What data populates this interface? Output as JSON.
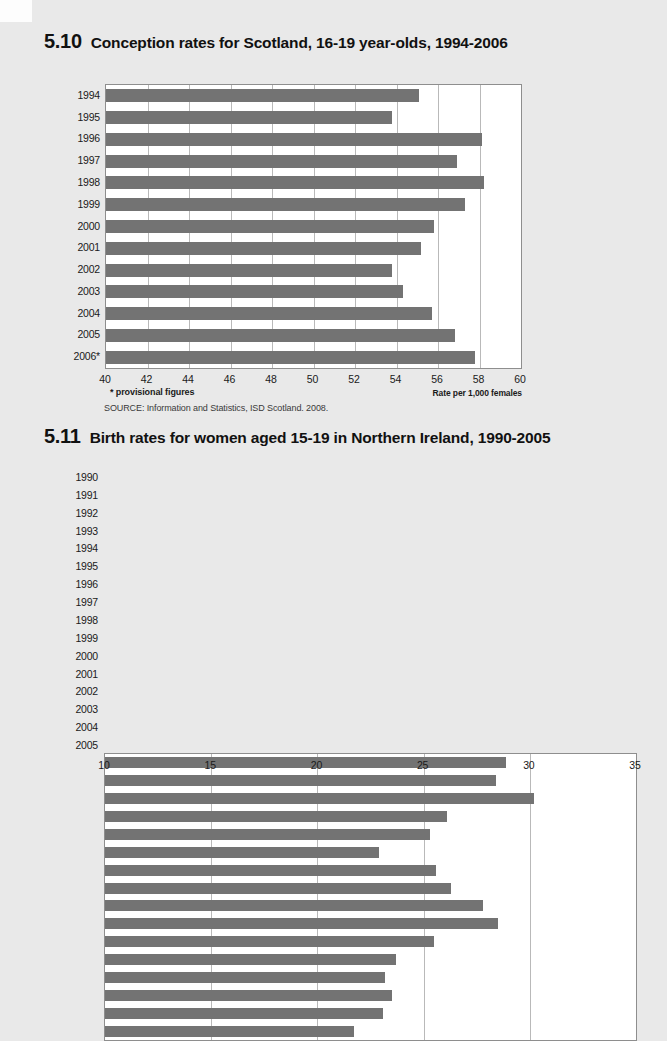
{
  "page": {
    "background_color": "#e9e9e9",
    "bar_color": "#737373",
    "grid_color": "#b9b9b9",
    "frame_color": "#8e8e8e"
  },
  "figures": [
    {
      "number": "5.10",
      "title": "Conception rates for Scotland, 16-19 year-olds, 1994-2006",
      "footnote": "* provisional figures",
      "axis_caption": "Rate per 1,000 females",
      "source": "SOURCE: Information and Statistics, ISD Scotland. 2008.",
      "chart_data": {
        "type": "bar",
        "orientation": "horizontal",
        "title": "Conception rates for Scotland, 16-19 year-olds, 1994-2006",
        "xlabel": "Rate per 1,000 females",
        "ylabel": "",
        "xlim": [
          40,
          60
        ],
        "xticks": [
          40,
          42,
          44,
          46,
          48,
          50,
          52,
          54,
          56,
          58,
          60
        ],
        "grid": true,
        "legend": false,
        "categories": [
          "1994",
          "1995",
          "1996",
          "1997",
          "1998",
          "1999",
          "2000",
          "2001",
          "2002",
          "2003",
          "2004",
          "2005",
          "2006*"
        ],
        "values": [
          55.1,
          53.8,
          58.1,
          56.9,
          58.2,
          57.3,
          55.8,
          55.2,
          53.8,
          54.3,
          55.7,
          56.8,
          57.8
        ]
      }
    },
    {
      "number": "5.11",
      "title": "Birth rates for women aged 15-19 in Northern Ireland, 1990-2005",
      "footnote": "",
      "axis_caption": "",
      "source": "",
      "chart_data": {
        "type": "bar",
        "orientation": "horizontal",
        "title": "Birth rates for women aged 15-19 in Northern Ireland, 1990-2005",
        "xlabel": "",
        "ylabel": "",
        "xlim": [
          10,
          35
        ],
        "xticks": [
          10,
          15,
          20,
          25,
          30,
          35
        ],
        "grid": true,
        "legend": false,
        "categories": [
          "1990",
          "1991",
          "1992",
          "1993",
          "1994",
          "1995",
          "1996",
          "1997",
          "1998",
          "1999",
          "2000",
          "2001",
          "2002",
          "2003",
          "2004",
          "2005"
        ],
        "values": [
          28.9,
          28.4,
          30.2,
          26.1,
          25.3,
          22.9,
          25.6,
          26.3,
          27.8,
          28.5,
          25.5,
          23.7,
          23.2,
          23.5,
          23.1,
          21.7
        ]
      }
    }
  ]
}
